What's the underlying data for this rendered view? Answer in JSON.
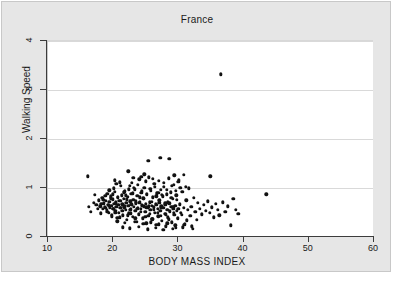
{
  "figure": {
    "title": "France",
    "background_color": "#e6e6e6",
    "plot_background_color": "#ffffff",
    "point_color": "#111111",
    "grid_color": "#d9d9d9"
  },
  "chart_data": {
    "type": "scatter",
    "title": "France",
    "xlabel": "BODY MASS INDEX",
    "ylabel": "Walking Speed",
    "xlim": [
      10,
      60
    ],
    "ylim": [
      0,
      4
    ],
    "xticks": [
      10,
      20,
      30,
      40,
      50,
      60
    ],
    "yticks": [
      0,
      1,
      2,
      3,
      4
    ],
    "grid": "horizontal",
    "legend": null,
    "series": [
      {
        "name": "participants",
        "marker": "filled-circle",
        "color": "#111111",
        "points": [
          [
            16.1,
            1.24
          ],
          [
            16.3,
            0.62
          ],
          [
            16.6,
            0.52
          ],
          [
            17.0,
            0.7
          ],
          [
            17.2,
            0.86
          ],
          [
            17.4,
            0.66
          ],
          [
            17.6,
            0.58
          ],
          [
            17.8,
            0.75
          ],
          [
            18.0,
            0.63
          ],
          [
            18.1,
            0.48
          ],
          [
            18.3,
            0.8
          ],
          [
            18.4,
            0.57
          ],
          [
            18.6,
            0.69
          ],
          [
            18.7,
            0.61
          ],
          [
            18.9,
            0.74
          ],
          [
            19.0,
            0.55
          ],
          [
            19.1,
            0.88
          ],
          [
            19.2,
            0.66
          ],
          [
            19.3,
            0.5
          ],
          [
            19.4,
            0.72
          ],
          [
            19.5,
            0.6
          ],
          [
            19.6,
            0.83
          ],
          [
            19.7,
            0.64
          ],
          [
            19.8,
            0.45
          ],
          [
            19.9,
            0.77
          ],
          [
            20.0,
            0.58
          ],
          [
            20.1,
            0.68
          ],
          [
            20.2,
            0.92
          ],
          [
            20.3,
            0.54
          ],
          [
            20.4,
            0.71
          ],
          [
            20.5,
            0.62
          ],
          [
            20.6,
            0.39
          ],
          [
            20.7,
            0.8
          ],
          [
            20.8,
            0.66
          ],
          [
            20.9,
            0.5
          ],
          [
            21.0,
            1.12
          ],
          [
            21.1,
            0.74
          ],
          [
            21.2,
            0.59
          ],
          [
            21.3,
            0.85
          ],
          [
            21.4,
            0.67
          ],
          [
            21.5,
            0.44
          ],
          [
            21.6,
            0.78
          ],
          [
            21.7,
            0.61
          ],
          [
            21.8,
            0.93
          ],
          [
            21.9,
            0.55
          ],
          [
            22.0,
            0.7
          ],
          [
            22.1,
            0.35
          ],
          [
            22.2,
            0.82
          ],
          [
            22.3,
            0.64
          ],
          [
            22.4,
            0.48
          ],
          [
            22.5,
            1.05
          ],
          [
            22.6,
            0.73
          ],
          [
            22.7,
            0.57
          ],
          [
            22.8,
            0.88
          ],
          [
            22.9,
            0.66
          ],
          [
            23.0,
            0.41
          ],
          [
            23.1,
            0.76
          ],
          [
            23.2,
            0.62
          ],
          [
            23.3,
            0.97
          ],
          [
            23.4,
            0.53
          ],
          [
            23.5,
            0.69
          ],
          [
            23.6,
            0.31
          ],
          [
            23.7,
            0.84
          ],
          [
            23.8,
            0.6
          ],
          [
            23.9,
            0.46
          ],
          [
            24.0,
            1.18
          ],
          [
            24.1,
            0.72
          ],
          [
            24.2,
            0.58
          ],
          [
            24.3,
            0.9
          ],
          [
            24.4,
            0.65
          ],
          [
            24.5,
            0.38
          ],
          [
            24.6,
            0.79
          ],
          [
            24.7,
            0.63
          ],
          [
            24.8,
            1.0
          ],
          [
            24.9,
            0.51
          ],
          [
            25.0,
            0.68
          ],
          [
            25.1,
            0.28
          ],
          [
            25.2,
            0.86
          ],
          [
            25.3,
            0.59
          ],
          [
            25.4,
            0.43
          ],
          [
            25.5,
            1.22
          ],
          [
            25.6,
            0.71
          ],
          [
            25.7,
            0.56
          ],
          [
            25.8,
            0.94
          ],
          [
            25.9,
            0.64
          ],
          [
            26.0,
            0.36
          ],
          [
            26.1,
            0.81
          ],
          [
            26.2,
            0.61
          ],
          [
            26.3,
            1.08
          ],
          [
            26.4,
            0.49
          ],
          [
            26.5,
            0.67
          ],
          [
            26.6,
            0.25
          ],
          [
            26.7,
            0.89
          ],
          [
            26.8,
            0.57
          ],
          [
            26.9,
            0.42
          ],
          [
            27.0,
            1.15
          ],
          [
            27.1,
            0.7
          ],
          [
            27.2,
            0.54
          ],
          [
            27.3,
            0.96
          ],
          [
            27.4,
            0.63
          ],
          [
            27.5,
            0.33
          ],
          [
            27.6,
            0.83
          ],
          [
            27.7,
            0.6
          ],
          [
            27.8,
            1.02
          ],
          [
            27.9,
            0.47
          ],
          [
            28.0,
            0.66
          ],
          [
            28.1,
            0.22
          ],
          [
            28.2,
            0.87
          ],
          [
            28.3,
            0.55
          ],
          [
            28.4,
            0.4
          ],
          [
            28.5,
            1.2
          ],
          [
            28.6,
            0.69
          ],
          [
            28.7,
            0.52
          ],
          [
            28.8,
            0.91
          ],
          [
            28.9,
            0.62
          ],
          [
            29.0,
            0.3
          ],
          [
            29.1,
            0.78
          ],
          [
            29.2,
            0.58
          ],
          [
            29.3,
            1.06
          ],
          [
            29.4,
            0.45
          ],
          [
            29.5,
            0.64
          ],
          [
            29.6,
            0.19
          ],
          [
            29.7,
            0.85
          ],
          [
            29.8,
            0.53
          ],
          [
            29.9,
            0.37
          ],
          [
            30.0,
            1.13
          ],
          [
            30.2,
            0.67
          ],
          [
            30.4,
            0.5
          ],
          [
            30.6,
            0.92
          ],
          [
            30.8,
            0.6
          ],
          [
            31.0,
            0.27
          ],
          [
            31.2,
            0.75
          ],
          [
            31.4,
            0.56
          ],
          [
            31.6,
            0.99
          ],
          [
            31.8,
            0.43
          ],
          [
            32.0,
            0.62
          ],
          [
            32.2,
            0.17
          ],
          [
            32.4,
            0.8
          ],
          [
            32.6,
            0.51
          ],
          [
            32.8,
            0.35
          ],
          [
            33.0,
            0.7
          ],
          [
            33.3,
            0.58
          ],
          [
            33.6,
            0.46
          ],
          [
            33.9,
            0.66
          ],
          [
            34.2,
            0.54
          ],
          [
            34.5,
            0.73
          ],
          [
            34.8,
            0.49
          ],
          [
            35.1,
            0.61
          ],
          [
            35.4,
            0.4
          ],
          [
            35.7,
            0.68
          ],
          [
            36.0,
            0.56
          ],
          [
            36.3,
            0.44
          ],
          [
            36.5,
            3.32
          ],
          [
            36.8,
            0.71
          ],
          [
            37.2,
            0.52
          ],
          [
            37.6,
            0.63
          ],
          [
            38.0,
            0.24
          ],
          [
            38.4,
            0.78
          ],
          [
            38.8,
            0.55
          ],
          [
            39.2,
            0.47
          ],
          [
            43.5,
            0.87
          ],
          [
            22.3,
            1.34
          ],
          [
            23.1,
            1.21
          ],
          [
            24.8,
            1.28
          ],
          [
            25.4,
            1.55
          ],
          [
            26.1,
            1.19
          ],
          [
            27.2,
            1.62
          ],
          [
            28.6,
            1.6
          ],
          [
            29.4,
            1.26
          ],
          [
            30.1,
            1.16
          ],
          [
            34.9,
            1.24
          ],
          [
            20.5,
            1.09
          ],
          [
            21.2,
            1.04
          ],
          [
            22.9,
            1.11
          ],
          [
            23.8,
            1.06
          ],
          [
            25.0,
            1.14
          ],
          [
            26.4,
            1.02
          ],
          [
            27.8,
            1.1
          ],
          [
            29.0,
            1.05
          ],
          [
            30.3,
            1.01
          ],
          [
            31.1,
            1.03
          ],
          [
            19.4,
            0.95
          ],
          [
            20.1,
            0.99
          ],
          [
            21.6,
            0.91
          ],
          [
            22.4,
            0.97
          ],
          [
            23.2,
            1.0
          ],
          [
            24.4,
            0.93
          ],
          [
            25.7,
            0.98
          ],
          [
            26.9,
            0.9
          ],
          [
            28.2,
            0.96
          ],
          [
            29.6,
            0.94
          ],
          [
            18.8,
            0.84
          ],
          [
            19.9,
            0.87
          ],
          [
            20.7,
            0.82
          ],
          [
            21.9,
            0.85
          ],
          [
            23.0,
            0.89
          ],
          [
            24.1,
            0.81
          ],
          [
            25.2,
            0.88
          ],
          [
            26.6,
            0.83
          ],
          [
            27.5,
            0.86
          ],
          [
            28.9,
            0.8
          ],
          [
            18.5,
            0.76
          ],
          [
            19.6,
            0.79
          ],
          [
            20.9,
            0.74
          ],
          [
            22.1,
            0.77
          ],
          [
            23.5,
            0.73
          ],
          [
            24.7,
            0.78
          ],
          [
            25.9,
            0.72
          ],
          [
            27.1,
            0.75
          ],
          [
            28.4,
            0.71
          ],
          [
            29.8,
            0.76
          ],
          [
            18.2,
            0.68
          ],
          [
            19.3,
            0.65
          ],
          [
            20.4,
            0.69
          ],
          [
            21.7,
            0.64
          ],
          [
            22.8,
            0.67
          ],
          [
            24.0,
            0.7
          ],
          [
            25.5,
            0.63
          ],
          [
            26.7,
            0.66
          ],
          [
            28.0,
            0.69
          ],
          [
            29.2,
            0.62
          ],
          [
            18.9,
            0.59
          ],
          [
            20.0,
            0.57
          ],
          [
            21.1,
            0.6
          ],
          [
            22.6,
            0.56
          ],
          [
            23.7,
            0.58
          ],
          [
            25.1,
            0.61
          ],
          [
            26.2,
            0.55
          ],
          [
            27.4,
            0.59
          ],
          [
            28.7,
            0.54
          ],
          [
            30.0,
            0.57
          ],
          [
            19.1,
            0.51
          ],
          [
            20.3,
            0.49
          ],
          [
            21.4,
            0.53
          ],
          [
            22.7,
            0.48
          ],
          [
            24.2,
            0.52
          ],
          [
            25.6,
            0.47
          ],
          [
            26.8,
            0.5
          ],
          [
            28.1,
            0.46
          ],
          [
            29.3,
            0.49
          ],
          [
            30.5,
            0.45
          ],
          [
            19.8,
            0.42
          ],
          [
            21.0,
            0.4
          ],
          [
            22.2,
            0.44
          ],
          [
            23.4,
            0.38
          ],
          [
            24.9,
            0.41
          ],
          [
            26.0,
            0.37
          ],
          [
            27.3,
            0.43
          ],
          [
            28.5,
            0.36
          ],
          [
            29.9,
            0.39
          ],
          [
            31.3,
            0.34
          ],
          [
            20.6,
            0.32
          ],
          [
            21.8,
            0.29
          ],
          [
            23.3,
            0.31
          ],
          [
            24.6,
            0.27
          ],
          [
            25.8,
            0.3
          ],
          [
            27.0,
            0.26
          ],
          [
            28.3,
            0.28
          ],
          [
            29.5,
            0.24
          ],
          [
            30.9,
            0.25
          ],
          [
            32.1,
            0.22
          ],
          [
            21.5,
            0.2
          ],
          [
            22.5,
            0.18
          ],
          [
            23.9,
            0.21
          ],
          [
            25.3,
            0.16
          ],
          [
            26.5,
            0.19
          ],
          [
            27.7,
            0.15
          ],
          [
            29.1,
            0.17
          ],
          [
            30.7,
            0.2
          ],
          [
            20.2,
            1.16
          ],
          [
            24.3,
            1.23
          ],
          [
            30.8,
            1.27
          ]
        ]
      }
    ]
  },
  "axes": {
    "x_tick_labels": [
      "10",
      "20",
      "30",
      "40",
      "50",
      "60"
    ],
    "y_tick_labels": [
      "0",
      "1",
      "2",
      "3",
      "4"
    ],
    "x_title": "BODY MASS INDEX",
    "y_title": "Walking Speed"
  }
}
